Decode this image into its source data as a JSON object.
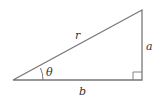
{
  "diagram": {
    "type": "right-triangle",
    "labels": {
      "hypotenuse": "r",
      "opposite": "a",
      "adjacent": "b",
      "angle": "θ"
    },
    "colors": {
      "stroke": "#777777",
      "text": "#333333"
    }
  }
}
